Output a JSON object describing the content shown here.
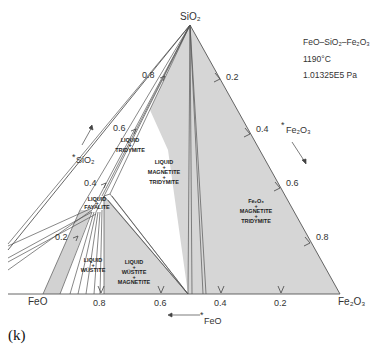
{
  "figure": {
    "system_title": "FeO–SiO₂–Fe₂O₃",
    "temperature": "1190°C",
    "pressure": "1.01325E5 Pa",
    "caption": "(k)"
  },
  "vertices": {
    "top": "SiO₂",
    "left": "FeO",
    "right": "Fe₂O₃"
  },
  "axes": {
    "sio2_axis_label": "SiO₂",
    "sio2_ticks": [
      "0.8",
      "0.6",
      "0.4",
      "0.2"
    ],
    "fe2o3_axis_label": "Fe₂O₃",
    "fe2o3_ticks": [
      "0.2",
      "0.4",
      "0.6",
      "0.8"
    ],
    "feo_axis_label": "FeO",
    "feo_ticks": [
      "0.8",
      "0.6",
      "0.4",
      "0.2"
    ]
  },
  "phase_regions": [
    {
      "id": "liquid-tridymite",
      "lines": [
        "LIQUID",
        "+",
        "TRIDYMITE"
      ]
    },
    {
      "id": "liquid-magnetite-tridymite",
      "lines": [
        "LIQUID",
        "+",
        "MAGNETITE",
        "+",
        "TRIDYMITE"
      ]
    },
    {
      "id": "liquid-fayalite",
      "lines": [
        "LIQUID",
        "+",
        "FAYALITE"
      ]
    },
    {
      "id": "liquid-wustite",
      "lines": [
        "LIQUID",
        "+",
        "WÜSTITE"
      ]
    },
    {
      "id": "liquid-wustite-magnetite",
      "lines": [
        "LIQUID",
        "+",
        "WÜSTITE",
        "+",
        "MAGNETITE"
      ]
    },
    {
      "id": "fe2o3-magnetite-tridymite",
      "lines": [
        "Fe₂O₃",
        "+",
        "MAGNETITE",
        "+",
        "TRIDYMITE"
      ]
    }
  ],
  "colors": {
    "region_fill": "#d4d4d4",
    "line": "#555555",
    "background": "#ffffff"
  }
}
